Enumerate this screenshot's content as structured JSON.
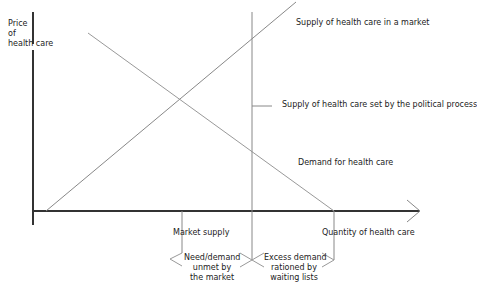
{
  "figure": {
    "y_axis_label": [
      "Price",
      "of",
      "health care"
    ],
    "x_axis_label": "Quantity of health care",
    "labels": {
      "market_supply_curve": "Supply of health care in a market",
      "political_supply": "Supply of health care set by the political process",
      "demand_curve": "Demand for health care",
      "market_supply_point": "Market supply",
      "unmet_need": [
        "Need/demand",
        "unmet by",
        "the market"
      ],
      "excess_demand": [
        "Excess demand",
        "rationed by",
        "waiting lists"
      ]
    },
    "colors": {
      "axis": "#333333",
      "curve": "#888888",
      "text": "#222222",
      "background": "#ffffff"
    }
  }
}
